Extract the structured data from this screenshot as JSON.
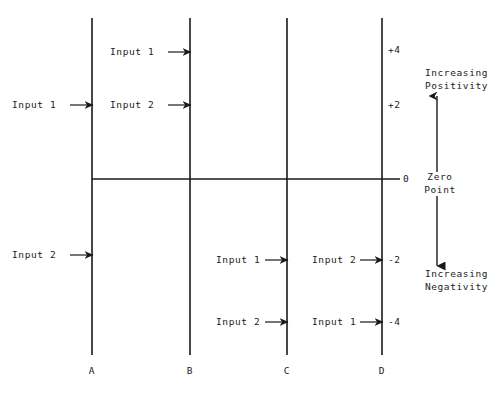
{
  "diagram": {
    "background_color": "#ffffff",
    "line_color": "#1a1a1a",
    "axes": [
      {
        "id": "A",
        "label": "A",
        "x": 92
      },
      {
        "id": "B",
        "label": "B",
        "x": 190
      },
      {
        "id": "C",
        "label": "C",
        "x": 287
      },
      {
        "id": "D",
        "label": "D",
        "x": 382
      }
    ],
    "zero_line": {
      "label": "0",
      "y": 179,
      "x_start": 92,
      "x_end": 400
    },
    "scale_ticks": [
      {
        "label": "+4",
        "value": 4,
        "y": 50
      },
      {
        "label": "+2",
        "value": 2,
        "y": 105
      },
      {
        "label": "0",
        "value": 0,
        "y": 179
      },
      {
        "label": "-2",
        "value": -2,
        "y": 260
      },
      {
        "label": "-4",
        "value": -4,
        "y": 322
      }
    ],
    "annotations": {
      "zero_point": "Zero\nPoint",
      "zero_point_line1": "Zero",
      "zero_point_line2": "Point",
      "increasing_positivity_line1": "Increasing",
      "increasing_positivity_line2": "Positivity",
      "increasing_negativity_line1": "Increasing",
      "increasing_negativity_line2": "Negativity"
    },
    "input_arrows": [
      {
        "label": "Input 1",
        "target_axis": "B",
        "value": 4,
        "y": 52,
        "text_x": 110,
        "arrow_from": 168,
        "arrow_to": 190
      },
      {
        "label": "Input 1",
        "target_axis": "A",
        "value": 2,
        "y": 105,
        "text_x": 12,
        "arrow_from": 70,
        "arrow_to": 92
      },
      {
        "label": "Input 2",
        "target_axis": "B",
        "value": 2,
        "y": 105,
        "text_x": 110,
        "arrow_from": 168,
        "arrow_to": 190
      },
      {
        "label": "Input 2",
        "target_axis": "A",
        "value": -2,
        "y": 255,
        "text_x": 12,
        "arrow_from": 70,
        "arrow_to": 92
      },
      {
        "label": "Input 1",
        "target_axis": "C",
        "value": -2,
        "y": 260,
        "text_x": 216,
        "arrow_from": 265,
        "arrow_to": 287
      },
      {
        "label": "Input 2",
        "target_axis": "D",
        "value": -2,
        "y": 260,
        "text_x": 312,
        "arrow_from": 360,
        "arrow_to": 382
      },
      {
        "label": "Input 2",
        "target_axis": "C",
        "value": -4,
        "y": 322,
        "text_x": 216,
        "arrow_from": 265,
        "arrow_to": 287
      },
      {
        "label": "Input 1",
        "target_axis": "D",
        "value": -4,
        "y": 322,
        "text_x": 312,
        "arrow_from": 360,
        "arrow_to": 382
      }
    ]
  }
}
